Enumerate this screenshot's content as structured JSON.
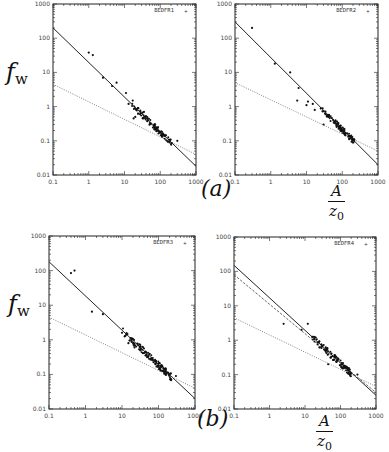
{
  "figure": {
    "y_label": {
      "base": "f",
      "sub": "w"
    },
    "x_label": {
      "numerator": "A",
      "denominator_base": "z",
      "denominator_sub": "0"
    },
    "group_labels": [
      "(a)",
      "(b)"
    ]
  },
  "chart_data": [
    {
      "type": "scatter",
      "title": "",
      "legend": "BEDFR1",
      "legend_position": "top-right",
      "xlabel": "A/z0",
      "ylabel": "f_w",
      "xscale": "log",
      "yscale": "log",
      "xlim": [
        0.1,
        1000
      ],
      "ylim": [
        0.01,
        1000
      ],
      "xticks": [
        "0.1",
        "1",
        "10",
        "100",
        "1000"
      ],
      "yticks": [
        "0.01",
        "0.1",
        "1",
        "10",
        "100",
        "1000"
      ],
      "grid": false,
      "frame": {
        "x": 53,
        "y": 4,
        "w": 143,
        "h": 171
      },
      "lines": [
        {
          "style": "solid",
          "from": [
            0.1,
            200
          ],
          "to": [
            1000,
            0.018
          ]
        },
        {
          "style": "dotted",
          "from": [
            0.1,
            4.5
          ],
          "to": [
            1000,
            0.04
          ]
        }
      ],
      "points": [
        [
          1.0,
          38
        ],
        [
          1.3,
          32
        ],
        [
          2.5,
          7
        ],
        [
          4.5,
          4
        ],
        [
          6,
          5
        ],
        [
          11,
          2.5
        ],
        [
          13,
          1.2
        ],
        [
          17,
          1.5
        ],
        [
          18,
          0.45
        ],
        [
          20,
          0.5
        ],
        [
          35,
          0.7
        ],
        [
          300,
          0.1
        ]
      ],
      "cluster": {
        "x_range": [
          15,
          220
        ],
        "fit": "solid",
        "count": 110,
        "spread": 0.18
      }
    },
    {
      "type": "scatter",
      "title": "",
      "legend": "BEDFR2",
      "legend_position": "top-right",
      "xlabel": "A/z0",
      "ylabel": "f_w",
      "xscale": "log",
      "yscale": "log",
      "xlim": [
        0.1,
        1000
      ],
      "ylim": [
        0.01,
        1000
      ],
      "xticks": [
        "0.1",
        "1",
        "10",
        "100",
        "1000"
      ],
      "yticks": [
        "0.01",
        "0.1",
        "1",
        "10",
        "100",
        "1000"
      ],
      "grid": false,
      "frame": {
        "x": 235,
        "y": 4,
        "w": 143,
        "h": 171
      },
      "lines": [
        {
          "style": "solid",
          "from": [
            0.1,
            300
          ],
          "to": [
            1000,
            0.02
          ]
        },
        {
          "style": "dotted",
          "from": [
            0.1,
            5
          ],
          "to": [
            1000,
            0.05
          ]
        }
      ],
      "points": [
        [
          0.3,
          200
        ],
        [
          1.3,
          18
        ],
        [
          3.5,
          10
        ],
        [
          6,
          3.5
        ],
        [
          5.5,
          1.5
        ],
        [
          10,
          1.1
        ],
        [
          11,
          1.4
        ],
        [
          15,
          1.2
        ],
        [
          17,
          0.8
        ],
        [
          30,
          0.3
        ]
      ],
      "cluster": {
        "x_range": [
          25,
          230
        ],
        "fit": "solid",
        "count": 110,
        "spread": 0.18
      }
    },
    {
      "type": "scatter",
      "title": "",
      "legend": "BEDFR3",
      "legend_position": "top-right",
      "xlabel": "A/z0",
      "ylabel": "f_w",
      "xscale": "log",
      "yscale": "log",
      "xlim": [
        0.1,
        1000
      ],
      "ylim": [
        0.01,
        1000
      ],
      "xticks": [
        "0.1",
        "1",
        "10",
        "100",
        "1000"
      ],
      "yticks": [
        "0.01",
        "0.1",
        "1",
        "10",
        "100",
        "1000"
      ],
      "grid": false,
      "frame": {
        "x": 49,
        "y": 236,
        "w": 146,
        "h": 173
      },
      "lines": [
        {
          "style": "solid",
          "from": [
            0.1,
            180
          ],
          "to": [
            1000,
            0.02
          ]
        },
        {
          "style": "dotted",
          "from": [
            0.1,
            4.5
          ],
          "to": [
            1000,
            0.04
          ]
        }
      ],
      "points": [
        [
          0.4,
          85
        ],
        [
          0.5,
          100
        ],
        [
          1.5,
          6.5
        ],
        [
          3,
          5.5
        ],
        [
          10,
          1.6
        ],
        [
          15,
          0.8
        ],
        [
          22,
          0.6
        ],
        [
          300,
          0.09
        ]
      ],
      "cluster": {
        "x_range": [
          10,
          230
        ],
        "fit": "solid",
        "count": 140,
        "spread": 0.2
      }
    },
    {
      "type": "scatter",
      "title": "",
      "legend": "BEDFR4",
      "legend_position": "top-right",
      "xlabel": "A/z0",
      "ylabel": "f_w",
      "xscale": "log",
      "yscale": "log",
      "xlim": [
        0.1,
        1000
      ],
      "ylim": [
        0.01,
        1000
      ],
      "xticks": [
        "0.1",
        "1",
        "10",
        "100",
        "1000"
      ],
      "yticks": [
        "0.01",
        "0.1",
        "1",
        "10",
        "100",
        "1000"
      ],
      "grid": false,
      "frame": {
        "x": 234,
        "y": 237,
        "w": 142,
        "h": 172
      },
      "lines": [
        {
          "style": "solid",
          "from": [
            0.1,
            150
          ],
          "to": [
            1000,
            0.025
          ]
        },
        {
          "style": "dashed",
          "from": [
            0.1,
            80
          ],
          "to": [
            1000,
            0.03
          ]
        },
        {
          "style": "dotted",
          "from": [
            0.1,
            4.5
          ],
          "to": [
            1000,
            0.045
          ]
        }
      ],
      "points": [
        [
          2.5,
          3
        ],
        [
          12,
          3
        ],
        [
          8,
          2
        ],
        [
          20,
          1.2
        ],
        [
          45,
          0.2
        ],
        [
          300,
          0.1
        ]
      ],
      "cluster": {
        "x_range": [
          15,
          200
        ],
        "fit": "solid",
        "count": 110,
        "spread": 0.2
      }
    }
  ]
}
